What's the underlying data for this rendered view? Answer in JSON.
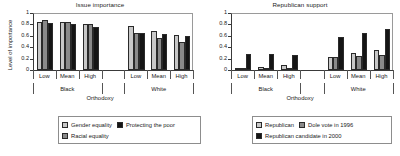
{
  "figure": {
    "axis_label": "Orthodoxy",
    "group_labels": [
      "Black",
      "White"
    ],
    "category_labels": [
      "Low",
      "Mean",
      "High"
    ]
  },
  "colors": {
    "series_light": "#c8c8c8",
    "series_medium": "#8a8a8a",
    "series_dark": "#151515",
    "axis": "#3a3a3a",
    "text": "#222222",
    "legend_border": "#8d8d8d"
  },
  "panels": {
    "left": {
      "title": "Issue importance",
      "ylabel": "Level of importance",
      "yticks": [
        "0",
        "0.2",
        "0.4",
        "0.6",
        "0.8",
        "1"
      ],
      "legend": [
        {
          "label": "Gender equality",
          "color": "#c8c8c8"
        },
        {
          "label": "Protecting the poor",
          "color": "#151515"
        },
        {
          "label": "Racial equality",
          "color": "#8a8a8a"
        }
      ]
    },
    "right": {
      "title": "Republican support",
      "ylabel": "",
      "yticks": [
        "0",
        "0.2",
        "0.4",
        "0.6",
        "0.8",
        "1"
      ],
      "legend": [
        {
          "label": "Republican",
          "color": "#c8c8c8"
        },
        {
          "label": "Dole vote in 1996",
          "color": "#8a8a8a"
        },
        {
          "label": "Republican candidate in 2000",
          "color": "#151515"
        }
      ]
    }
  },
  "chart_data": [
    {
      "type": "bar",
      "title": "Issue importance",
      "xlabel": "Orthodoxy",
      "ylabel": "Level of importance",
      "ylim": [
        0,
        1
      ],
      "yticks": [
        0,
        0.2,
        0.4,
        0.6,
        0.8,
        1
      ],
      "grid": false,
      "legend_position": "below",
      "groups": [
        "Black",
        "White"
      ],
      "categories": [
        "Low",
        "Mean",
        "High"
      ],
      "series": [
        {
          "name": "Gender equality",
          "color": "#c8c8c8",
          "values": {
            "Black": [
              0.85,
              0.85,
              0.81
            ],
            "White": [
              0.77,
              0.69,
              0.61
            ]
          }
        },
        {
          "name": "Racial equality",
          "color": "#8a8a8a",
          "values": {
            "Black": [
              0.87,
              0.85,
              0.81
            ],
            "White": [
              0.65,
              0.57,
              0.49
            ]
          }
        },
        {
          "name": "Protecting the poor",
          "color": "#151515",
          "values": {
            "Black": [
              0.83,
              0.8,
              0.75
            ],
            "White": [
              0.65,
              0.63,
              0.59
            ]
          }
        }
      ]
    },
    {
      "type": "bar",
      "title": "Republican support",
      "xlabel": "Orthodoxy",
      "ylabel": "",
      "ylim": [
        0,
        1
      ],
      "yticks": [
        0,
        0.2,
        0.4,
        0.6,
        0.8,
        1
      ],
      "grid": false,
      "legend_position": "below",
      "groups": [
        "Black",
        "White"
      ],
      "categories": [
        "Low",
        "Mean",
        "High"
      ],
      "series": [
        {
          "name": "Republican",
          "color": "#c8c8c8",
          "values": {
            "Black": [
              0.03,
              0.06,
              0.09
            ],
            "White": [
              0.23,
              0.29,
              0.35
            ]
          }
        },
        {
          "name": "Dole vote in 1996",
          "color": "#8a8a8a",
          "values": {
            "Black": [
              0.01,
              0.02,
              0.02
            ],
            "White": [
              0.22,
              0.24,
              0.27
            ]
          }
        },
        {
          "name": "Republican candidate in 2000",
          "color": "#151515",
          "values": {
            "Black": [
              0.28,
              0.28,
              0.27
            ],
            "White": [
              0.58,
              0.65,
              0.72
            ]
          }
        }
      ]
    }
  ]
}
